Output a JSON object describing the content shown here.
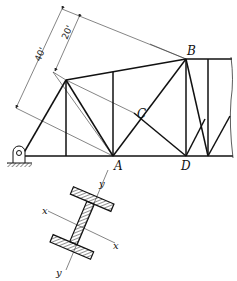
{
  "figure": {
    "type": "truss-diagram",
    "truss": {
      "node_labels": {
        "A": "A",
        "B": "B",
        "C": "C",
        "D": "D"
      },
      "dimensions": [
        {
          "label": "40'",
          "meaning": "distance along inclined dimension line"
        },
        {
          "label": "20'",
          "meaning": "distance along inclined dimension line"
        }
      ],
      "support": "pin-support-icon"
    },
    "section": {
      "type": "wide-flange-I-section",
      "axes": {
        "x_label_1": "x",
        "x_label_2": "x",
        "y_label_1": "y",
        "y_label_2": "y"
      }
    },
    "colors": {
      "line": "#111111",
      "thin_line": "#333333",
      "background": "#ffffff"
    }
  }
}
